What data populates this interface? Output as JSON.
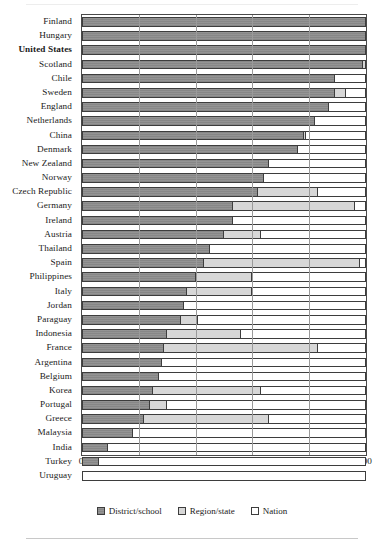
{
  "chart_data": {
    "type": "bar",
    "subtype": "horizontal-stacked-100",
    "title": "",
    "xlabel": "% of decisions at each level",
    "ylabel": "",
    "xlim": [
      0,
      100
    ],
    "xticks": [
      0,
      20,
      40,
      60,
      80,
      100
    ],
    "grid": true,
    "legend_position": "bottom",
    "highlight_category": "United States",
    "categories": [
      "Finland",
      "Hungary",
      "United States",
      "Scotland",
      "Chile",
      "Sweden",
      "England",
      "Netherlands",
      "China",
      "Denmark",
      "New Zealand",
      "Norway",
      "Czech Republic",
      "Germany",
      "Ireland",
      "Austria",
      "Thailand",
      "Spain",
      "Philippines",
      "Italy",
      "Jordan",
      "Paraguay",
      "Indonesia",
      "France",
      "Argentina",
      "Belgium",
      "Korea",
      "Portugal",
      "Greece",
      "Malaysia",
      "India",
      "Turkey",
      "Uruguay"
    ],
    "series": [
      {
        "name": "District/school",
        "color": "#8e8e8e",
        "values": [
          100,
          100,
          100,
          99,
          89,
          89,
          87,
          82,
          78,
          76,
          66,
          64,
          62,
          53,
          53,
          50,
          45,
          43,
          40,
          37,
          36,
          35,
          30,
          29,
          28,
          27,
          25,
          24,
          22,
          18,
          9,
          6,
          0
        ]
      },
      {
        "name": "Region/state",
        "color": "#d7d7d7",
        "values": [
          0,
          0,
          0,
          1,
          0,
          4,
          0,
          0,
          1,
          0,
          0,
          0,
          21,
          43,
          0,
          13,
          0,
          55,
          20,
          23,
          0,
          6,
          26,
          54,
          0,
          0,
          38,
          6,
          44,
          0,
          0,
          0,
          0
        ]
      },
      {
        "name": "Nation",
        "color": "#ffffff",
        "values": [
          0,
          0,
          0,
          0,
          11,
          7,
          13,
          18,
          21,
          24,
          34,
          36,
          17,
          4,
          47,
          37,
          55,
          2,
          40,
          40,
          64,
          59,
          44,
          17,
          72,
          73,
          37,
          70,
          34,
          82,
          91,
          94,
          100
        ]
      }
    ]
  },
  "axis": {
    "x_title": "% of decisions at each level",
    "tick_labels": [
      "0",
      "20",
      "40",
      "60",
      "80",
      "100"
    ]
  },
  "legend": {
    "items": [
      {
        "label": "District/school",
        "swatch": "district"
      },
      {
        "label": "Region/state",
        "swatch": "region"
      },
      {
        "label": "Nation",
        "swatch": "nation"
      }
    ]
  }
}
